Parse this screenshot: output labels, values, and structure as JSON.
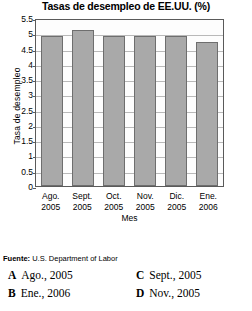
{
  "chart_data": {
    "type": "bar",
    "title": "Tasas de desempleo de EE.UU. (%)",
    "xlabel": "Mes",
    "ylabel": "Tasa de desempleo",
    "categories": [
      "Ago. 2005",
      "Sept. 2005",
      "Oct. 2005",
      "Nov. 2005",
      "Dic. 2005",
      "Ene. 2006"
    ],
    "category_lines": [
      {
        "month": "Ago.",
        "year": "2005"
      },
      {
        "month": "Sept.",
        "year": "2005"
      },
      {
        "month": "Oct.",
        "year": "2005"
      },
      {
        "month": "Nov.",
        "year": "2005"
      },
      {
        "month": "Dic.",
        "year": "2005"
      },
      {
        "month": "Ene.",
        "year": "2006"
      }
    ],
    "values": [
      4.9,
      5.1,
      4.9,
      4.9,
      4.9,
      4.7
    ],
    "ylim": [
      0,
      5.5
    ],
    "ytick_labels": [
      "5.5",
      "5",
      "4.5",
      "4",
      "3.5",
      "3",
      "2.5",
      "2",
      "1.5",
      "1",
      "0.5",
      "0"
    ],
    "ytick_values": [
      5.5,
      5,
      4.5,
      4,
      3.5,
      3,
      2.5,
      2,
      1.5,
      1,
      0.5,
      0
    ],
    "grid": true,
    "legend": "none",
    "bar_color": "#a9a9a9",
    "bar_border_color": "#6e6e6e",
    "axis_color": "#5a5a5a",
    "grid_color": "#b9b9b9"
  },
  "source": {
    "label": "Fuente:",
    "text": "U.S. Department of Labor"
  },
  "options": [
    {
      "letter": "A",
      "text": "Ago., 2005"
    },
    {
      "letter": "B",
      "text": "Ene., 2006"
    },
    {
      "letter": "C",
      "text": "Sept., 2005"
    },
    {
      "letter": "D",
      "text": "Nov., 2005"
    }
  ]
}
